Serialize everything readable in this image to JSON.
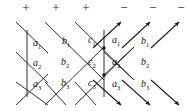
{
  "figure": {
    "name": "signed-lattice-diagram",
    "background_color": "#ffffff",
    "line_color": "#1a1a1a",
    "label_color": "#111111"
  },
  "signs": {
    "plus_symbol": "+",
    "minus_symbol": "−",
    "items": [
      {
        "symbol": "+",
        "x": 19
      },
      {
        "symbol": "+",
        "x": 49
      },
      {
        "symbol": "+",
        "x": 79
      },
      {
        "symbol": "−",
        "x": 117
      },
      {
        "symbol": "−",
        "x": 146
      },
      {
        "symbol": "−",
        "x": 174
      }
    ]
  },
  "labels": {
    "rows": [
      {
        "row": 1,
        "cells": [
          {
            "base": "a",
            "sub": "1",
            "x": 33,
            "y": 38
          },
          {
            "base": "b",
            "sub": "1",
            "x": 62,
            "y": 36
          },
          {
            "base": "c",
            "sub": "1",
            "x": 88,
            "y": 35
          },
          {
            "base": "a",
            "sub": "1",
            "x": 112,
            "y": 35
          },
          {
            "base": "b",
            "sub": "1",
            "x": 141,
            "y": 36
          }
        ]
      },
      {
        "row": 2,
        "cells": [
          {
            "base": "a",
            "sub": "2",
            "x": 33,
            "y": 58
          },
          {
            "base": "b",
            "sub": "2",
            "x": 61,
            "y": 57
          },
          {
            "base": "c",
            "sub": "2",
            "x": 88,
            "y": 57
          },
          {
            "base": "a",
            "sub": "2",
            "x": 112,
            "y": 57
          },
          {
            "base": "b",
            "sub": "2",
            "x": 141,
            "y": 57
          }
        ]
      },
      {
        "row": 3,
        "cells": [
          {
            "base": "a",
            "sub": "3",
            "x": 33,
            "y": 79
          },
          {
            "base": "b",
            "sub": "3",
            "x": 61,
            "y": 78
          },
          {
            "base": "c",
            "sub": "3",
            "x": 88,
            "y": 78
          },
          {
            "base": "a",
            "sub": "3",
            "x": 112,
            "y": 79
          },
          {
            "base": "b",
            "sub": "3",
            "x": 141,
            "y": 79
          }
        ]
      }
    ]
  },
  "geometry": {
    "down_right_lines": [
      {
        "x1": 16,
        "y1": 22,
        "x2": 48,
        "y2": 53
      },
      {
        "x1": 45,
        "y1": 22,
        "x2": 104,
        "y2": 80
      },
      {
        "x1": 75,
        "y1": 22,
        "x2": 134,
        "y2": 80
      },
      {
        "x1": 16,
        "y1": 52,
        "x2": 48,
        "y2": 83
      },
      {
        "x1": 16,
        "y1": 82,
        "x2": 48,
        "y2": 105
      },
      {
        "x1": 45,
        "y1": 82,
        "x2": 66,
        "y2": 105
      },
      {
        "x1": 75,
        "y1": 82,
        "x2": 96,
        "y2": 105
      },
      {
        "x1": 104,
        "y1": 52,
        "x2": 134,
        "y2": 80
      }
    ],
    "up_right_lines": [
      {
        "x1": 16,
        "y1": 105,
        "x2": 48,
        "y2": 74
      },
      {
        "x1": 45,
        "y1": 105,
        "x2": 104,
        "y2": 47
      },
      {
        "x1": 75,
        "y1": 105,
        "x2": 134,
        "y2": 47
      },
      {
        "x1": 104,
        "y1": 75,
        "x2": 134,
        "y2": 47
      }
    ],
    "arrows_up_right": [
      {
        "x1": 93,
        "y1": 48,
        "x2": 122,
        "y2": 21
      },
      {
        "x1": 122,
        "y1": 48,
        "x2": 151,
        "y2": 21
      },
      {
        "x1": 151,
        "y1": 48,
        "x2": 180,
        "y2": 21
      }
    ],
    "arrows_down_right": [
      {
        "x1": 93,
        "y1": 80,
        "x2": 122,
        "y2": 106
      },
      {
        "x1": 122,
        "y1": 80,
        "x2": 151,
        "y2": 106
      },
      {
        "x1": 151,
        "y1": 80,
        "x2": 180,
        "y2": 106
      }
    ],
    "vertical_lines": [
      {
        "x": 27,
        "y1": 30,
        "y2": 97
      },
      {
        "x": 104,
        "y1": 30,
        "y2": 97
      }
    ],
    "crossing_nodes": [
      {
        "x": 104,
        "y": 48
      },
      {
        "x": 104,
        "y": 75
      }
    ]
  }
}
